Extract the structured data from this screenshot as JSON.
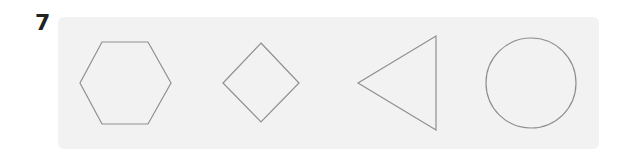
{
  "question": {
    "number": "7"
  },
  "panel": {
    "background": "#f2f2f2",
    "stroke_color": "#8f8f8f"
  },
  "shapes": [
    {
      "name": "hexagon"
    },
    {
      "name": "diamond"
    },
    {
      "name": "triangle"
    },
    {
      "name": "circle"
    }
  ]
}
